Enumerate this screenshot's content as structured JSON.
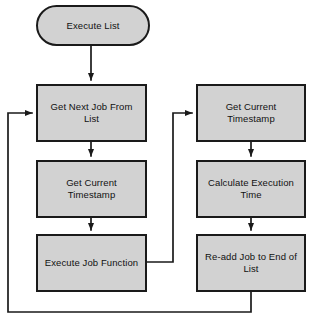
{
  "diagram": {
    "type": "flowchart",
    "colors": {
      "node_fill": "#d2d2d2",
      "node_border": "#1a1a1a",
      "connector": "#1a1a1a",
      "background": "#ffffff",
      "text": "#111111"
    },
    "nodes": [
      {
        "id": "execute-list",
        "label": "Execute List",
        "shape": "terminator",
        "x": 36,
        "y": 5,
        "w": 114,
        "h": 41
      },
      {
        "id": "get-next-job-from-list",
        "label": "Get Next Job From List",
        "shape": "process",
        "x": 36,
        "y": 84,
        "w": 111,
        "h": 58
      },
      {
        "id": "get-current-timestamp-left",
        "label": "Get Current Timestamp",
        "shape": "process",
        "x": 36,
        "y": 160,
        "w": 111,
        "h": 58
      },
      {
        "id": "execute-job-function",
        "label": "Execute Job Function",
        "shape": "process",
        "x": 36,
        "y": 234,
        "w": 111,
        "h": 58
      },
      {
        "id": "get-current-timestamp-right",
        "label": "Get Current Timestamp",
        "shape": "process",
        "x": 196,
        "y": 84,
        "w": 110,
        "h": 58
      },
      {
        "id": "calculate-execution-time",
        "label": "Calculate Execution Time",
        "shape": "process",
        "x": 196,
        "y": 160,
        "w": 110,
        "h": 58
      },
      {
        "id": "re-add-job-to-end-of-list",
        "label": "Re-add Job to End of List",
        "shape": "process",
        "x": 196,
        "y": 234,
        "w": 110,
        "h": 58
      }
    ],
    "connectors": [
      {
        "id": "start-to-get-next-job",
        "from": "execute-list",
        "to": "get-next-job-from-list",
        "label": ""
      },
      {
        "id": "get-next-job-to-timestamp",
        "from": "get-next-job-from-list",
        "to": "get-current-timestamp-left",
        "label": ""
      },
      {
        "id": "timestamp-to-execute-job",
        "from": "get-current-timestamp-left",
        "to": "execute-job-function",
        "label": ""
      },
      {
        "id": "execute-job-to-timestamp-right",
        "from": "execute-job-function",
        "to": "get-current-timestamp-right",
        "label": ""
      },
      {
        "id": "timestamp-right-to-calculate",
        "from": "get-current-timestamp-right",
        "to": "calculate-execution-time",
        "label": ""
      },
      {
        "id": "calculate-to-readd",
        "from": "calculate-execution-time",
        "to": "re-add-job-to-end-of-list",
        "label": ""
      },
      {
        "id": "readd-loop-back-to-get-next-job",
        "from": "re-add-job-to-end-of-list",
        "to": "get-next-job-from-list",
        "label": ""
      }
    ]
  }
}
